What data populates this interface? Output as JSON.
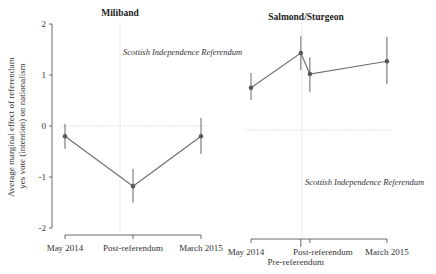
{
  "chart_data": [
    {
      "type": "line",
      "title": "Miliband",
      "ylabel": "Average marginal effect of referendum yes vote (intention) on nationalism",
      "ylim": [
        -2,
        2
      ],
      "yticks": [
        "2",
        "1",
        "0",
        "-1",
        "-2"
      ],
      "ytick_values": [
        2,
        1,
        0,
        -1,
        -2
      ],
      "categories": [
        "May 2014",
        "Post-referendum",
        "March 2015"
      ],
      "x": [
        0,
        1,
        2
      ],
      "values": [
        -0.2,
        -1.18,
        -0.2
      ],
      "ci_low": [
        -0.45,
        -1.5,
        -0.55
      ],
      "ci_high": [
        0.04,
        -0.84,
        0.16
      ],
      "reference_line_y": 0,
      "vertical_marker": {
        "label": "Scottish Independence Referendum",
        "at_x": 1
      }
    },
    {
      "type": "line",
      "title": "Salmond/Sturgeon",
      "ylim": [
        -2,
        2
      ],
      "categories": [
        "May 2014",
        "Pre-referendum",
        "Post-referendum",
        "March 2015"
      ],
      "x": [
        0,
        1.1,
        1.3,
        3
      ],
      "values": [
        0.75,
        1.43,
        1.02,
        1.27
      ],
      "ci_low": [
        0.51,
        1.1,
        0.67,
        0.82
      ],
      "ci_high": [
        1.04,
        1.76,
        1.35,
        1.75
      ],
      "reference_line_y": 0,
      "vertical_marker": {
        "label": "Scottish Independence Referendum",
        "at_x": 1.2
      }
    }
  ]
}
